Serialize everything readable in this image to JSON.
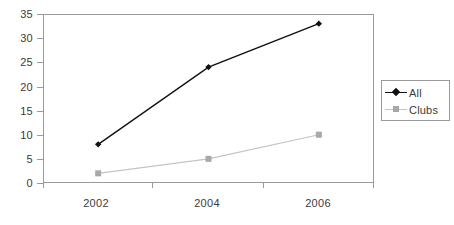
{
  "chart_data": {
    "type": "line",
    "title": "",
    "xlabel": "",
    "ylabel": "",
    "categories": [
      "2002",
      "2004",
      "2006"
    ],
    "series": [
      {
        "name": "All",
        "values": [
          8,
          24,
          33
        ],
        "color": "#111111",
        "marker": "diamond"
      },
      {
        "name": "Clubs",
        "values": [
          2,
          5,
          10
        ],
        "color": "#c4c4c4",
        "marker": "square"
      }
    ],
    "ylim": [
      0,
      35
    ],
    "yticks": [
      0,
      5,
      10,
      15,
      20,
      25,
      30,
      35
    ],
    "ytick_labels": [
      "0",
      "5",
      "10",
      "15",
      "20",
      "25",
      "30",
      "35"
    ],
    "grid": false,
    "legend_position": "right"
  },
  "legend": {
    "entries": [
      {
        "label": "All",
        "key": "diamond-marker-icon"
      },
      {
        "label": "Clubs",
        "key": "square-marker-icon"
      }
    ]
  },
  "colors": {
    "axis": "#9a9a9a",
    "text": "#3b3b3b",
    "series_all": "#111111",
    "series_clubs": "#c4c4c4",
    "background": "#ffffff"
  }
}
